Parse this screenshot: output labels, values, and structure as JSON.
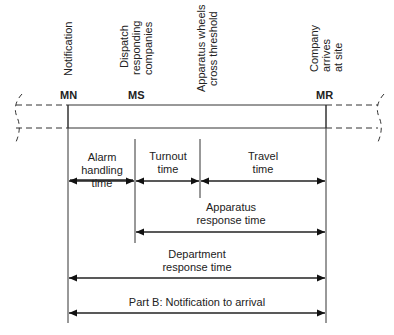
{
  "diagram": {
    "events": [
      {
        "label": "Notification",
        "lines": [
          "Notification"
        ],
        "x": 68
      },
      {
        "label": "Dispatch responding companies",
        "lines": [
          "Dispatch",
          "responding",
          "companies"
        ],
        "x": 135
      },
      {
        "label": "Apparatus wheels cross threshold",
        "lines": [
          "Apparatus wheels",
          "cross threshold"
        ],
        "x": 200
      },
      {
        "label": "Company arrives at site",
        "lines": [
          "Company",
          "arrives",
          "at site"
        ],
        "x": 326
      }
    ],
    "markers": {
      "mn": "MN",
      "ms": "MS",
      "mr": "MR"
    },
    "intervals": {
      "alarm_handling": {
        "lines": [
          "Alarm",
          "handling",
          "time"
        ],
        "from": "MN",
        "to": "MS"
      },
      "turnout": {
        "lines": [
          "Turnout",
          "time"
        ],
        "from": "MS",
        "to": "Threshold"
      },
      "travel": {
        "lines": [
          "Travel",
          "time"
        ],
        "from": "Threshold",
        "to": "MR"
      },
      "apparatus_response": {
        "lines": [
          "Apparatus",
          "response time"
        ],
        "from": "MS",
        "to": "MR"
      },
      "department_response": {
        "lines": [
          "Department",
          "response time"
        ],
        "from": "MN",
        "to": "MR"
      },
      "part_b": {
        "label": "Part B: Notification to arrival",
        "from": "MN",
        "to": "MR"
      }
    }
  }
}
